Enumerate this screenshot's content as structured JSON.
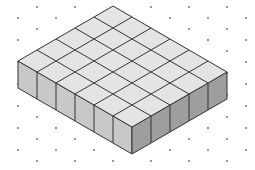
{
  "diagram": {
    "title": "Isometric rectangular prism of unit cubes",
    "cubes": {
      "rows": 5,
      "columns": 6,
      "layers": 1,
      "total": 30
    },
    "colors": {
      "background": "#ffffff",
      "top_face": "#e4e4e4",
      "left_face": "#c8c8c8",
      "right_face": "#9e9e9e",
      "edge": "#333333",
      "dot": "#666666"
    },
    "geometry": {
      "top_vertex": [
        113,
        6
      ],
      "step_left": [
        -19,
        11
      ],
      "step_right": [
        19,
        11
      ],
      "height": 27
    },
    "dot_grid": {
      "spacing_x": 38,
      "spacing_y": 11,
      "row_offset": 19,
      "origin": [
        18,
        7
      ]
    }
  }
}
